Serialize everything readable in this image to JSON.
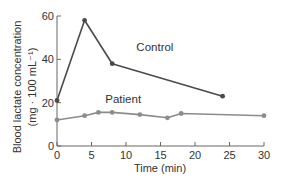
{
  "chart_data": {
    "type": "line",
    "title": "",
    "xlabel": "Time (min)",
    "ylabel": "Blood lactate concentration",
    "ylabel_units": "(mg · 100 mL⁻¹)",
    "xlim": [
      0,
      30
    ],
    "ylim": [
      0,
      60
    ],
    "xticks": [
      0,
      5,
      10,
      15,
      20,
      25,
      30
    ],
    "yticks": [
      0,
      20,
      40,
      60
    ],
    "grid": false,
    "legend": "inline labels",
    "series": [
      {
        "name": "Control",
        "color": "#4a4a4a",
        "label_pos": {
          "x": 11.5,
          "y": 44
        },
        "x": [
          0,
          4,
          8,
          24
        ],
        "y": [
          21,
          58,
          38,
          23
        ]
      },
      {
        "name": "Patient",
        "color": "#8c8c8c",
        "label_pos": {
          "x": 7,
          "y": 20
        },
        "x": [
          0,
          4,
          6,
          8,
          12,
          16,
          18,
          30
        ],
        "y": [
          12,
          14,
          15.5,
          15.5,
          14.5,
          13,
          15,
          14
        ]
      }
    ]
  }
}
